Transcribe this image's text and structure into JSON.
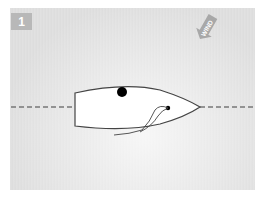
{
  "diagram": {
    "step_number": "1",
    "wind_label": "WIND",
    "wind_direction": "from top-right toward bottom-left",
    "elements": {
      "centerline": "dashed line",
      "boat": "dinghy hull outline, bow pointing right",
      "crew": "black dot (helm) near top of hull",
      "mast": "small black dot near bow",
      "sail": "curved sail/sheet lines trailing from mast"
    },
    "colors": {
      "background": "#dedede",
      "badge": "#b8b8b8",
      "badge_text": "#ffffff",
      "hull_fill": "#ffffff",
      "hull_stroke": "#444444",
      "dashed_line": "#777777",
      "wind_arrow": "#a8a8a8",
      "dots": "#000000"
    }
  }
}
